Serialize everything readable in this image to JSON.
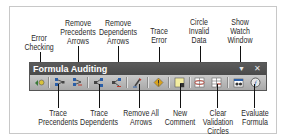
{
  "toolbar": {
    "title": "Formula Auditing",
    "dropdown_icon": "▼",
    "close_icon": "✕"
  },
  "callouts_top": [
    {
      "id": "error-checking",
      "label": "Error\nChecking"
    },
    {
      "id": "remove-precedents-arrows",
      "label": "Remove\nPrecedents\nArrows"
    },
    {
      "id": "remove-dependents-arrows",
      "label": "Remove\nDependents\nArrows"
    },
    {
      "id": "trace-error",
      "label": "Trace\nError"
    },
    {
      "id": "circle-invalid-data",
      "label": "Circle\nInvalid\nData"
    },
    {
      "id": "show-watch-window",
      "label": "Show\nWatch\nWindow"
    }
  ],
  "callouts_bottom": [
    {
      "id": "trace-precedents",
      "label": "Trace\nPrecendents"
    },
    {
      "id": "trace-dependents",
      "label": "Trace\nDependents"
    },
    {
      "id": "remove-all-arrows",
      "label": "Remove All\nArrows"
    },
    {
      "id": "new-comment",
      "label": "New\nComment"
    },
    {
      "id": "clear-validation-circles",
      "label": "Clear\nValidation\nCircles"
    },
    {
      "id": "evaluate-formula",
      "label": "Evaluate\nFormula"
    }
  ],
  "colors": {
    "titlebar": "#4f4f4f",
    "iconrow": "#b8b8b8",
    "accent_red": "#c0392b",
    "accent_blue": "#2b5fa8"
  }
}
